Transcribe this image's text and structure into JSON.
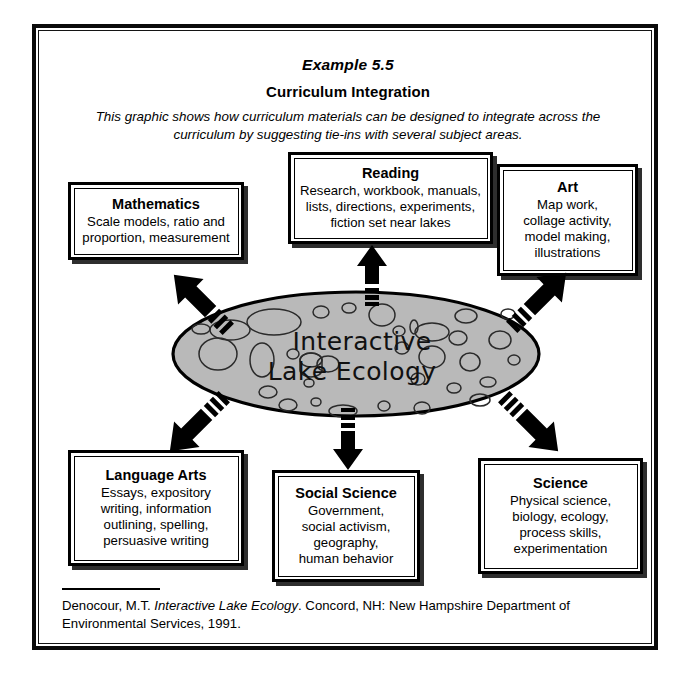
{
  "header": {
    "example_label": "Example 5.5",
    "title": "Curriculum Integration",
    "description": "This graphic shows how curriculum materials can be designed to integrate across the curriculum by suggesting tie-ins with several subject areas."
  },
  "center": {
    "line1": "Interactive",
    "line2": "Lake Ecology",
    "fill_color": "#b9b9b9",
    "stroke_color": "#000000"
  },
  "boxes": [
    {
      "id": "mathematics",
      "title": "Mathematics",
      "body": "Scale models, ratio and\nproportion, measurement"
    },
    {
      "id": "reading",
      "title": "Reading",
      "body": "Research, workbook, manuals,\nlists, directions, experiments,\nfiction set near lakes"
    },
    {
      "id": "art",
      "title": "Art",
      "body": "Map work,\ncollage activity,\nmodel making,\nillustrations"
    },
    {
      "id": "language-arts",
      "title": "Language Arts",
      "body": "Essays, expository\nwriting, information\noutlining, spelling,\npersuasive writing"
    },
    {
      "id": "social-science",
      "title": "Social Science",
      "body": "Government,\nsocial activism,\ngeography,\nhuman behavior"
    },
    {
      "id": "science",
      "title": "Science",
      "body": "Physical science,\nbiology, ecology,\nprocess skills,\nexperimentation"
    }
  ],
  "arrows": [
    {
      "id": "to-mathematics",
      "direction": "up-left"
    },
    {
      "id": "to-reading",
      "direction": "up"
    },
    {
      "id": "to-art",
      "direction": "up-right"
    },
    {
      "id": "to-language-arts",
      "direction": "down-left"
    },
    {
      "id": "to-social-science",
      "direction": "down"
    },
    {
      "id": "to-science",
      "direction": "down-right"
    }
  ],
  "citation": {
    "author": "Denocour, M.T.",
    "work_title": "Interactive Lake Ecology",
    "publication": ". Concord, NH: New Hampshire Department of Environmental Services, 1991."
  }
}
